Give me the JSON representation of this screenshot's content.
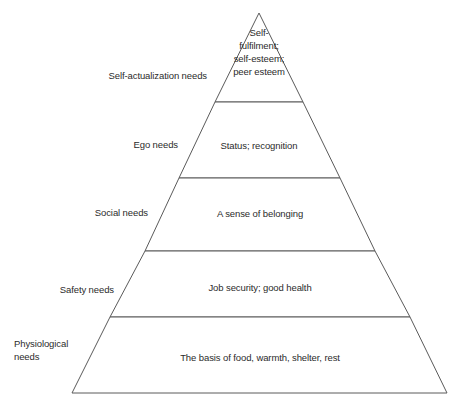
{
  "diagram": {
    "name": "hierarchy-of-needs-pyramid",
    "type": "pyramid",
    "background_color": "#ffffff",
    "line_color": "#5a5a5a",
    "text_color": "#2b2b2b"
  },
  "chart_data": {
    "type": "pyramid",
    "title": "",
    "levels_top_to_bottom": [
      {
        "index": 1,
        "side_label": "Self-actualization needs",
        "side_label_lines": [
          "Self-actualization needs"
        ],
        "content_lines": [
          "Self-",
          "fulfilment;",
          "self-esteem;",
          "peer esteem"
        ],
        "content_text": "Self-fulfilment; self-esteem; peer esteem"
      },
      {
        "index": 2,
        "side_label": "Ego needs",
        "side_label_lines": [
          "Ego needs"
        ],
        "content_lines": [
          "Status; recognition"
        ],
        "content_text": "Status; recognition"
      },
      {
        "index": 3,
        "side_label": "Social needs",
        "side_label_lines": [
          "Social needs"
        ],
        "content_lines": [
          "A sense of belonging"
        ],
        "content_text": "A sense of belonging"
      },
      {
        "index": 4,
        "side_label": "Safety needs",
        "side_label_lines": [
          "Safety needs"
        ],
        "content_lines": [
          "Job security; good health"
        ],
        "content_text": "Job security; good health"
      },
      {
        "index": 5,
        "side_label": "Physiological needs",
        "side_label_lines": [
          "Physiological",
          "needs"
        ],
        "content_lines": [
          "The basis of food, warmth, shelter, rest"
        ],
        "content_text": "The basis of food, warmth, shelter, rest"
      }
    ]
  },
  "geometry": {
    "apex": {
      "x": 259,
      "y": 13
    },
    "base_left": {
      "x": 72,
      "y": 393
    },
    "base_right": {
      "x": 447,
      "y": 393
    },
    "divider_y": [
      102,
      178,
      251,
      317
    ],
    "tier_polygons": [
      "259,13 303,102 215,102",
      "215,102 303,102 340,178 179,178",
      "179,178 340,178 375,251 145,251",
      "145,251 375,251 410,317 110,317",
      "110,317 410,317 447,393 72,393"
    ],
    "tier_text_anchor": [
      {
        "x": 259,
        "y": 52
      },
      {
        "x": 259,
        "y": 146
      },
      {
        "x": 260,
        "y": 214
      },
      {
        "x": 260,
        "y": 288
      },
      {
        "x": 260,
        "y": 358
      }
    ],
    "side_label_anchor": [
      {
        "x": 207,
        "y": 76
      },
      {
        "x": 178,
        "y": 145
      },
      {
        "x": 148,
        "y": 213
      },
      {
        "x": 114,
        "y": 290
      },
      {
        "x": 14,
        "y": 350
      }
    ],
    "side_label_align": [
      "end",
      "end",
      "end",
      "end",
      "start"
    ],
    "line_height": 13
  }
}
